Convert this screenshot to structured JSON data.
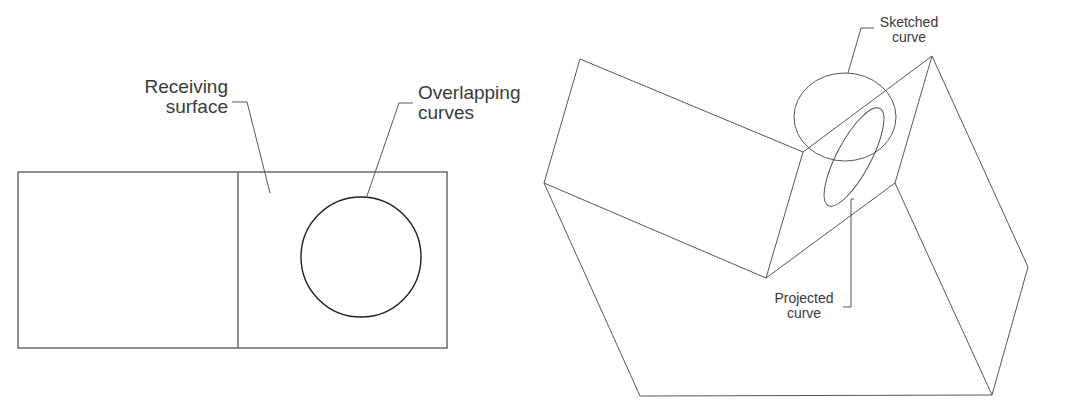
{
  "figure": {
    "left_panel": {
      "name": "overlapping-curves-view",
      "labels": {
        "receiving_surface": {
          "line1": "Receiving",
          "line2": "surface"
        },
        "overlapping_curves": {
          "line1": "Overlapping",
          "line2": "curves"
        }
      }
    },
    "right_panel": {
      "name": "projected-curve-isometric-view",
      "labels": {
        "sketched_curve": {
          "line1": "Sketched",
          "line2": "curve"
        },
        "projected_curve": {
          "line1": "Projected",
          "line2": "curve"
        }
      }
    },
    "colors": {
      "line": "#333333",
      "text": "#3a3a3a",
      "background": "#ffffff"
    }
  }
}
